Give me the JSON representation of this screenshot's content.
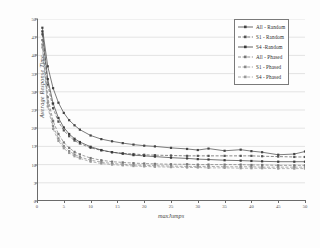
{
  "chart_data": {
    "type": "line",
    "title": "",
    "xlabel": "maxJumps",
    "ylabel": "Average Response Time",
    "xlim": [
      0,
      50
    ],
    "ylim": [
      0,
      50
    ],
    "xticks": [
      0,
      5,
      10,
      15,
      20,
      25,
      30,
      35,
      40,
      45,
      50
    ],
    "yticks": [
      0,
      5,
      10,
      15,
      20,
      25,
      30,
      35,
      40,
      45,
      50
    ],
    "grid": true,
    "grid_axis": "y",
    "legend_position": "top-right",
    "x": [
      1,
      2,
      3,
      4,
      5,
      6,
      7,
      8,
      10,
      12,
      14,
      16,
      18,
      20,
      22,
      25,
      28,
      30,
      32,
      35,
      38,
      40,
      42,
      45,
      48,
      50
    ],
    "series": [
      {
        "name": "All - Random",
        "color": "#444444",
        "linestyle": "solid",
        "marker": "diamond",
        "values": [
          47.6,
          37.0,
          31.0,
          27.0,
          24.2,
          22.2,
          20.8,
          19.6,
          18.0,
          17.0,
          16.4,
          15.9,
          15.5,
          15.2,
          15.0,
          14.6,
          14.3,
          14.0,
          14.4,
          13.8,
          14.1,
          13.7,
          13.4,
          12.7,
          12.9,
          13.6
        ]
      },
      {
        "name": "S1 - Random",
        "color": "#555555",
        "linestyle": "dashed",
        "marker": "diamond",
        "values": [
          45.8,
          32.0,
          25.5,
          21.8,
          19.4,
          17.8,
          16.6,
          15.8,
          14.6,
          13.9,
          13.4,
          13.1,
          12.9,
          12.7,
          12.6,
          12.5,
          12.4,
          12.4,
          12.4,
          12.4,
          12.4,
          12.4,
          12.3,
          12.2,
          12.1,
          12.1
        ]
      },
      {
        "name": "S4 -Random",
        "color": "#3b3b3b",
        "linestyle": "solid",
        "marker": "diamond",
        "values": [
          46.6,
          33.5,
          26.8,
          22.8,
          20.2,
          18.4,
          17.1,
          16.2,
          14.9,
          14.0,
          13.4,
          13.0,
          12.6,
          12.4,
          12.2,
          11.9,
          11.7,
          11.5,
          11.4,
          11.2,
          11.1,
          11.0,
          10.9,
          10.8,
          10.8,
          10.8
        ]
      },
      {
        "name": "All - Phased",
        "color": "#777777",
        "linestyle": "dashed",
        "marker": "diamond",
        "values": [
          44.2,
          28.5,
          22.0,
          18.4,
          16.1,
          14.6,
          13.5,
          12.8,
          11.8,
          11.2,
          10.8,
          10.6,
          10.4,
          10.3,
          10.2,
          10.1,
          10.1,
          10.0,
          10.0,
          10.0,
          10.0,
          9.9,
          9.9,
          9.8,
          9.8,
          9.8
        ]
      },
      {
        "name": "S1 - Phased",
        "color": "#8a8a8a",
        "linestyle": "dashed",
        "marker": "diamond",
        "values": [
          43.0,
          27.0,
          20.6,
          17.2,
          15.1,
          13.7,
          12.8,
          12.1,
          11.2,
          10.7,
          10.3,
          10.1,
          9.9,
          9.8,
          9.7,
          9.6,
          9.5,
          9.5,
          9.5,
          9.4,
          9.4,
          9.4,
          9.3,
          9.3,
          9.3,
          9.3
        ]
      },
      {
        "name": "S4 - Phased",
        "color": "#9a9a9a",
        "linestyle": "dashed",
        "marker": "diamond",
        "values": [
          42.2,
          26.0,
          19.8,
          16.5,
          14.5,
          13.2,
          12.3,
          11.7,
          10.8,
          10.3,
          10.0,
          9.8,
          9.6,
          9.5,
          9.4,
          9.3,
          9.2,
          9.2,
          9.1,
          9.1,
          9.0,
          9.0,
          9.0,
          8.9,
          8.9,
          8.9
        ]
      }
    ]
  }
}
